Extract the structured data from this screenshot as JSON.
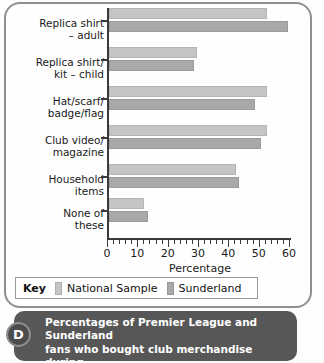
{
  "figure": {
    "badge_label": "D",
    "caption_lines": [
      "Percentages of Premier League and Sunderland",
      "fans who bought club merchandise during",
      "1996/1997 season"
    ]
  },
  "legend": {
    "title": "Key",
    "items": [
      {
        "label": "National Sample",
        "color": "#c5c5c5",
        "swatch_icon": "legend-swatch-icon"
      },
      {
        "label": "Sunderland",
        "color": "#a9a9a9",
        "swatch_icon": "legend-swatch-icon"
      }
    ]
  },
  "axis": {
    "x_title": "Percentage",
    "x_ticks": [
      "0",
      "10",
      "20",
      "30",
      "40",
      "50",
      "60"
    ]
  },
  "category_lines": [
    [
      "Replica shirt",
      "– adult"
    ],
    [
      "Replica shirt/",
      "kit – child"
    ],
    [
      "Hat/scarf/",
      "badge/flag"
    ],
    [
      "Club video/",
      "magazine"
    ],
    [
      "Household",
      "items"
    ],
    [
      "None of",
      "these"
    ]
  ],
  "chart_data": {
    "type": "bar",
    "orientation": "horizontal",
    "xlabel": "Percentage",
    "ylabel": "",
    "xlim": [
      0,
      60
    ],
    "xticks": [
      0,
      10,
      20,
      30,
      40,
      50,
      60
    ],
    "minor_tick_interval": 2,
    "grid": false,
    "legend_position": "bottom",
    "categories": [
      "Replica shirt – adult",
      "Replica shirt/kit – child",
      "Hat/scarf/badge/flag",
      "Club video/magazine",
      "Household items",
      "None of these"
    ],
    "series": [
      {
        "name": "National Sample",
        "color": "#c5c5c5",
        "values": [
          52,
          29,
          52,
          52,
          42,
          11.5
        ]
      },
      {
        "name": "Sunderland",
        "color": "#a9a9a9",
        "values": [
          59,
          28,
          48,
          50,
          43,
          13
        ]
      }
    ]
  }
}
